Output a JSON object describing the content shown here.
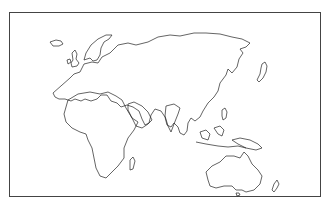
{
  "map": {
    "type": "outline-map",
    "region": "Eastern Hemisphere (Europe, Africa, Asia, Oceania)",
    "regions_shown": [
      "Europe",
      "Africa",
      "Asia",
      "Australia",
      "Indonesia",
      "Japan",
      "New Zealand"
    ],
    "colors": {
      "stroke": "#222222",
      "background": "#ffffff",
      "frame": "#444444"
    }
  }
}
